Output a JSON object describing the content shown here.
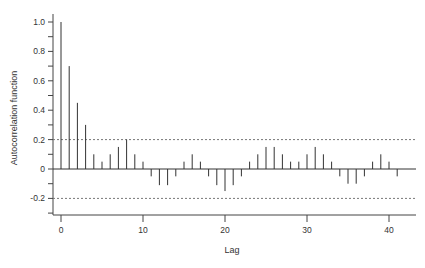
{
  "chart_data": {
    "type": "bar",
    "subtype": "acf-stem",
    "title": "",
    "xlabel": "Lag",
    "ylabel": "Autocorrelation function",
    "x": [
      0,
      1,
      2,
      3,
      4,
      5,
      6,
      7,
      8,
      9,
      10,
      11,
      12,
      13,
      14,
      15,
      16,
      17,
      18,
      19,
      20,
      21,
      22,
      23,
      24,
      25,
      26,
      27,
      28,
      29,
      30,
      31,
      32,
      33,
      34,
      35,
      36,
      37,
      38,
      39,
      40,
      41
    ],
    "values": [
      1.0,
      0.7,
      0.45,
      0.3,
      0.1,
      0.05,
      0.1,
      0.15,
      0.2,
      0.1,
      0.05,
      -0.05,
      -0.11,
      -0.11,
      -0.05,
      0.05,
      0.1,
      0.05,
      -0.05,
      -0.11,
      -0.15,
      -0.11,
      -0.05,
      0.05,
      0.1,
      0.15,
      0.15,
      0.1,
      0.05,
      0.05,
      0.1,
      0.15,
      0.1,
      0.05,
      -0.05,
      -0.1,
      -0.1,
      -0.05,
      0.05,
      0.1,
      0.05,
      -0.05
    ],
    "confidence_bounds": [
      0.2,
      -0.2
    ],
    "xlim": [
      -1,
      43
    ],
    "ylim": [
      -0.3,
      1.05
    ],
    "x_ticks": [
      0,
      10,
      20,
      30,
      40
    ],
    "y_ticks": [
      "1.0",
      "0.8",
      "0.6",
      "0.4",
      "0.2",
      "0",
      "-0.2"
    ],
    "y_tick_values": [
      1.0,
      0.8,
      0.6,
      0.4,
      0.2,
      0,
      -0.2
    ],
    "grid": false,
    "legend": null
  }
}
